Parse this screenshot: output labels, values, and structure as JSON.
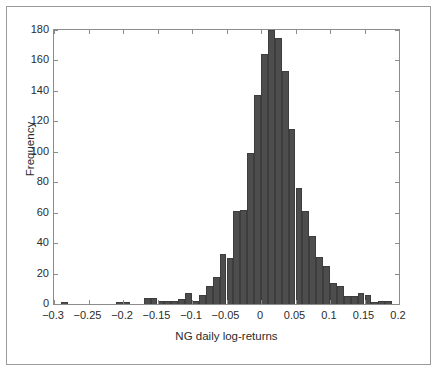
{
  "figure": {
    "background_color": "#ffffff",
    "frame_color": "#9a9a9a",
    "axis_color": "#8c8c8c"
  },
  "chart_data": {
    "type": "bar",
    "subtype": "histogram",
    "title": "",
    "xlabel": "NG daily log-returns",
    "ylabel": "Frequency",
    "xlim": [
      -0.3,
      0.2
    ],
    "ylim": [
      0,
      180
    ],
    "xticks": [
      -0.3,
      -0.25,
      -0.2,
      -0.15,
      -0.1,
      -0.05,
      0,
      0.05,
      0.1,
      0.15,
      0.2
    ],
    "xtick_labels": [
      "−0.3",
      "−0.25",
      "−0.2",
      "−0.15",
      "−0.1",
      "−0.05",
      "0",
      "0.05",
      "0.1",
      "0.15",
      "0.2"
    ],
    "yticks": [
      0,
      20,
      40,
      60,
      80,
      100,
      120,
      140,
      160,
      180
    ],
    "ytick_labels": [
      "0",
      "20",
      "40",
      "60",
      "80",
      "100",
      "120",
      "140",
      "160",
      "180"
    ],
    "grid": false,
    "legend": null,
    "bar_color": "#4d4d4d",
    "bar_edge_color": "#3d3d3d",
    "bin_width": 0.01,
    "bin_edges": [
      -0.29,
      -0.28,
      -0.27,
      -0.26,
      -0.25,
      -0.24,
      -0.23,
      -0.22,
      -0.21,
      -0.2,
      -0.19,
      -0.18,
      -0.17,
      -0.16,
      -0.15,
      -0.14,
      -0.13,
      -0.12,
      -0.11,
      -0.1,
      -0.09,
      -0.08,
      -0.07,
      -0.06,
      -0.05,
      -0.04,
      -0.03,
      -0.02,
      -0.01,
      0.0,
      0.01,
      0.02,
      0.03,
      0.04,
      0.05,
      0.06,
      0.07,
      0.08,
      0.09,
      0.1,
      0.11,
      0.12,
      0.13,
      0.14,
      0.15,
      0.16,
      0.17,
      0.18,
      0.19
    ],
    "bin_centers": [
      -0.285,
      -0.275,
      -0.265,
      -0.255,
      -0.245,
      -0.235,
      -0.225,
      -0.215,
      -0.205,
      -0.195,
      -0.185,
      -0.175,
      -0.165,
      -0.155,
      -0.145,
      -0.135,
      -0.125,
      -0.115,
      -0.105,
      -0.095,
      -0.085,
      -0.075,
      -0.065,
      -0.055,
      -0.045,
      -0.035,
      -0.025,
      -0.015,
      -0.005,
      0.005,
      0.015,
      0.025,
      0.035,
      0.045,
      0.055,
      0.065,
      0.075,
      0.085,
      0.095,
      0.105,
      0.115,
      0.125,
      0.135,
      0.145,
      0.155,
      0.165,
      0.175,
      0.185
    ],
    "values": [
      1,
      0,
      0,
      0,
      0,
      0,
      0,
      0,
      1,
      1,
      0,
      0,
      4,
      4,
      2,
      2,
      2,
      3,
      7,
      2,
      6,
      12,
      18,
      33,
      30,
      61,
      62,
      99,
      137,
      164,
      180,
      175,
      153,
      115,
      76,
      61,
      45,
      31,
      25,
      14,
      12,
      5,
      5,
      7,
      6,
      1,
      2,
      2
    ],
    "categories": [
      "-0.285",
      "-0.275",
      "-0.265",
      "-0.255",
      "-0.245",
      "-0.235",
      "-0.225",
      "-0.215",
      "-0.205",
      "-0.195",
      "-0.185",
      "-0.175",
      "-0.165",
      "-0.155",
      "-0.145",
      "-0.135",
      "-0.125",
      "-0.115",
      "-0.105",
      "-0.095",
      "-0.085",
      "-0.075",
      "-0.065",
      "-0.055",
      "-0.045",
      "-0.035",
      "-0.025",
      "-0.015",
      "-0.005",
      "0.005",
      "0.015",
      "0.025",
      "0.035",
      "0.045",
      "0.055",
      "0.065",
      "0.075",
      "0.085",
      "0.095",
      "0.105",
      "0.115",
      "0.125",
      "0.135",
      "0.145",
      "0.155",
      "0.165",
      "0.175",
      "0.185"
    ]
  }
}
